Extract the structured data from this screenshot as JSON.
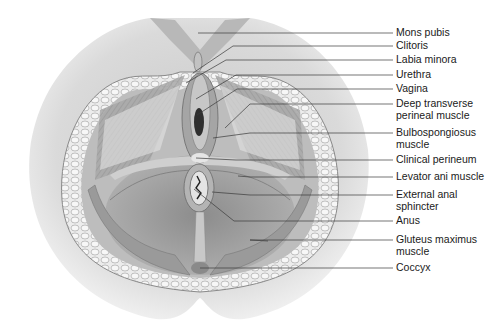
{
  "diagram": {
    "labels": [
      {
        "id": "mons-pubis",
        "text": "Mons pubis",
        "y": 33,
        "tip": [
          198,
          33
        ]
      },
      {
        "id": "clitoris",
        "text": "Clitoris",
        "y": 46,
        "tip": [
          193,
          73
        ]
      },
      {
        "id": "labia-minora",
        "text": "Labia minora",
        "y": 60,
        "tip": [
          186,
          83
        ]
      },
      {
        "id": "urethra",
        "text": "Urethra",
        "y": 75,
        "tip": [
          196,
          99
        ]
      },
      {
        "id": "vagina",
        "text": "Vagina",
        "y": 89,
        "tip": [
          197,
          115
        ]
      },
      {
        "id": "deep-transverse-perineal-muscle",
        "text": "Deep transverse\nperineal muscle",
        "y": 104,
        "tip": [
          225,
          128
        ]
      },
      {
        "id": "bulbospongiosus-muscle",
        "text": "Bulbospongiosus\nmuscle",
        "y": 133,
        "tip": [
          213,
          138
        ]
      },
      {
        "id": "clinical-perineum",
        "text": "Clinical perineum",
        "y": 160,
        "tip": [
          196,
          158
        ]
      },
      {
        "id": "levator-ani-muscle",
        "text": "Levator ani muscle",
        "y": 177,
        "tip": [
          238,
          176
        ]
      },
      {
        "id": "external-anal-sphincter",
        "text": "External anal\nsphincter",
        "y": 195,
        "tip": [
          212,
          192
        ]
      },
      {
        "id": "anus",
        "text": "Anus",
        "y": 221,
        "tip": [
          194,
          189
        ]
      },
      {
        "id": "gluteus-maximus-muscle",
        "text": "Gluteus maximus\nmuscle",
        "y": 240,
        "tip": [
          268,
          241
        ]
      },
      {
        "id": "coccyx",
        "text": "Coccyx",
        "y": 268,
        "tip": [
          200,
          268
        ]
      }
    ],
    "colors": {
      "skin": "#d6d6d6",
      "skin_dark": "#bdbdbd",
      "fat": "#e9e9e9",
      "muscle": "#9a9a9a",
      "muscle_light": "#bcbcbc",
      "line": "#3a3a3a",
      "text": "#1a1a1a"
    }
  }
}
